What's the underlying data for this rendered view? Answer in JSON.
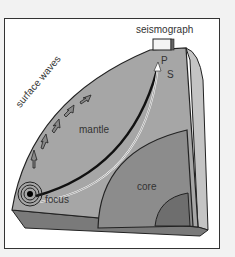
{
  "diagram": {
    "labels": {
      "seismograph": "seismograph",
      "p_wave": "P",
      "s_wave": "S",
      "surface_waves": "surface waves",
      "mantle": "mantle",
      "core": "core",
      "focus": "focus"
    },
    "colors": {
      "background": "#f2f2f2",
      "frame": "#ffffff",
      "mantle_face": "#a6a6a6",
      "mantle_side": "#c4c4c4",
      "outer_core": "#8c8c8c",
      "inner_core": "#6e6e6e",
      "base": "#7a7a7a",
      "outline": "#222222"
    }
  }
}
